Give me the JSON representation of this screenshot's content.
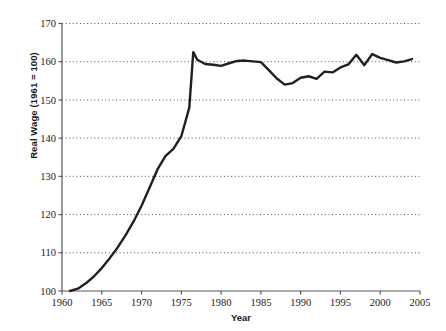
{
  "chart_data": {
    "type": "line",
    "title": "",
    "xlabel": "Year",
    "ylabel": "Real Wage (1961 = 100)",
    "xlim": [
      1960,
      2005
    ],
    "ylim": [
      100,
      170
    ],
    "xticks": [
      1960,
      1965,
      1970,
      1975,
      1980,
      1985,
      1990,
      1995,
      2000,
      2005
    ],
    "yticks": [
      100,
      110,
      120,
      130,
      140,
      150,
      160,
      170
    ],
    "xtick_labels": [
      "1960",
      "1965",
      "1970",
      "1975",
      "1980",
      "1985",
      "1990",
      "1995",
      "2000",
      "2005"
    ],
    "ytick_labels": [
      "100",
      "110",
      "120",
      "130",
      "140",
      "150",
      "160",
      "170"
    ],
    "grid": "horizontal-dotted",
    "legend": "none",
    "line_color": "#231f20",
    "line_width": 2.4,
    "series": [
      {
        "name": "Real Wage",
        "x": [
          1961,
          1962,
          1963,
          1964,
          1965,
          1966,
          1967,
          1968,
          1969,
          1970,
          1971,
          1972,
          1973,
          1974,
          1975,
          1976,
          1976.5,
          1977,
          1978,
          1979,
          1980,
          1981,
          1982,
          1983,
          1984,
          1985,
          1986,
          1987,
          1988,
          1989,
          1990,
          1991,
          1992,
          1993,
          1994,
          1995,
          1996,
          1997,
          1998,
          1999,
          2000,
          2001,
          2002,
          2003,
          2004
        ],
        "y": [
          100.0,
          100.6,
          102.0,
          103.8,
          106.0,
          108.6,
          111.4,
          114.6,
          118.2,
          122.3,
          127.0,
          131.8,
          135.3,
          137.2,
          140.5,
          148.0,
          162.5,
          160.5,
          159.4,
          159.2,
          158.9,
          159.6,
          160.2,
          160.3,
          160.1,
          159.9,
          157.8,
          155.6,
          154.0,
          154.4,
          155.8,
          156.2,
          155.5,
          157.4,
          157.2,
          158.5,
          159.3,
          161.8,
          159.1,
          162.0,
          161.0,
          160.4,
          159.8,
          160.1,
          160.7
        ]
      }
    ]
  },
  "axes": {
    "x_axis_name": "year-axis",
    "y_axis_name": "real-wage-axis"
  }
}
